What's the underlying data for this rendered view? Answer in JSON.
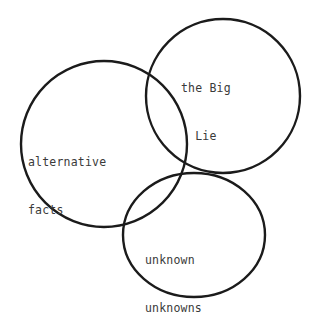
{
  "diagram": {
    "type": "venn",
    "title": "",
    "background_color": "#ffffff",
    "stroke_color": "#1b1b1b",
    "text_color": "#3a3a3a",
    "sets": [
      {
        "id": "alternative-facts",
        "label_line1": "alternative",
        "label_line2": "facts",
        "shape": "circle",
        "cx": 104,
        "cy": 144,
        "r": 83
      },
      {
        "id": "big-lie",
        "label_line1": "the Big",
        "label_line2": "Lie",
        "shape": "circle",
        "cx": 223,
        "cy": 96,
        "r": 77
      },
      {
        "id": "unknown-unknowns",
        "label_line1": "unknown",
        "label_line2": "unknowns",
        "shape": "ellipse",
        "cx": 194,
        "cy": 235,
        "rx": 71,
        "ry": 62
      }
    ]
  }
}
